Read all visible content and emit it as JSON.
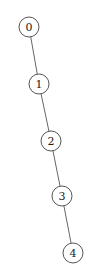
{
  "diagram": {
    "type": "tree",
    "nodes": [
      {
        "id": "0",
        "label": "0",
        "cx": 29,
        "cy": 27
      },
      {
        "id": "1",
        "label": "1",
        "cx": 39,
        "cy": 84
      },
      {
        "id": "2",
        "label": "2",
        "cx": 51,
        "cy": 141
      },
      {
        "id": "3",
        "label": "3",
        "cx": 62,
        "cy": 196
      },
      {
        "id": "4",
        "label": "4",
        "cx": 73,
        "cy": 253
      }
    ],
    "edges": [
      {
        "from": "0",
        "to": "1"
      },
      {
        "from": "1",
        "to": "2"
      },
      {
        "from": "2",
        "to": "3"
      },
      {
        "from": "3",
        "to": "4"
      }
    ],
    "node_radius": 10
  }
}
